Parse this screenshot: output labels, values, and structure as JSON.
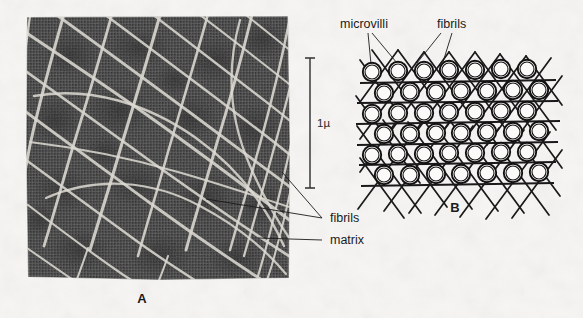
{
  "figure": {
    "background_color": "#f6f5f3",
    "ink_color": "#1b1b1b",
    "panels": [
      {
        "id": "A",
        "letter": "A",
        "type": "electron-micrograph",
        "description": "Dark halftone micrograph showing a crosshatched network of light fibrils over a mottled matrix",
        "bounds": {
          "x": 26,
          "y": 16,
          "width": 264,
          "height": 264
        },
        "letter_position": {
          "x": 142,
          "y": 303
        },
        "matrix_color": "#4d4d4d",
        "fibril_color": "#d9d7d0",
        "annotations": [
          {
            "label": "fibrils",
            "text_x": 330,
            "text_y": 222,
            "leaders": 2
          },
          {
            "label": "matrix",
            "text_x": 330,
            "text_y": 244,
            "leaders": 1
          }
        ],
        "scale_bar": {
          "label": "1µ",
          "orientation": "vertical",
          "x": 310,
          "y_top": 58,
          "y_bottom": 188,
          "label_x": 317,
          "label_y": 126,
          "cap_half_width": 5
        }
      },
      {
        "id": "B",
        "letter": "B",
        "type": "schematic-diagram",
        "description": "Hexagonally packed circles representing microvilli cross-sections with crossing fibril lines forming a lattice",
        "bounds": {
          "x": 355,
          "y": 55,
          "width": 200,
          "height": 125
        },
        "letter_position": {
          "x": 455,
          "y": 212
        },
        "lattice": {
          "rows": 6,
          "columns": 7,
          "circle_outer_radius": 9.2,
          "circle_inner_radius": 7.0,
          "row_spacing": 20.5,
          "column_spacing": 25.5,
          "origin_x": 371,
          "origin_y": 72,
          "row_offsets": [
            0,
            11,
            0,
            11,
            0,
            11
          ],
          "horizontal_lines": 6,
          "diagonal_slope": 1.45
        },
        "annotations": [
          {
            "label": "microvilli",
            "text_x": 340,
            "text_y": 28,
            "leaders": 2
          },
          {
            "label": "fibrils",
            "text_x": 437,
            "text_y": 28,
            "leaders": 2
          }
        ]
      }
    ]
  }
}
